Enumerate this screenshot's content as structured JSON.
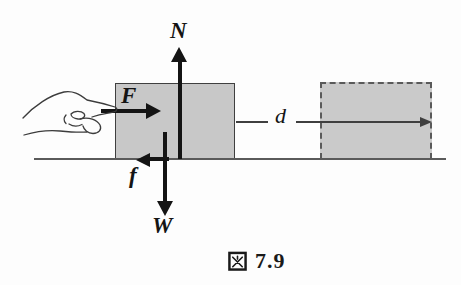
{
  "figure": {
    "type": "physics-force-diagram",
    "caption": {
      "prefix_symbol": "図",
      "number": "7.9",
      "full": "図 7.9"
    },
    "force_labels": {
      "normal": "N",
      "applied": "F",
      "friction": "f",
      "weight": "W"
    },
    "displacement_label": "d",
    "elements": {
      "block": "gray block pushed by hand",
      "ghost_block": "dashed outline of block after displacement",
      "hand": "hand pushing block with extended finger",
      "ground": "horizontal surface line"
    },
    "colors": {
      "block_fill": "#c8c8c8",
      "block_border": "#3f3f3f",
      "ghost_fill": "#cacaca",
      "ghost_border": "#5a5a5a",
      "arrow": "#141414",
      "ground": "#5a5a5a",
      "hand_stroke": "#3c3c3c",
      "text": "#141414",
      "background": "#fdfdfd"
    }
  }
}
